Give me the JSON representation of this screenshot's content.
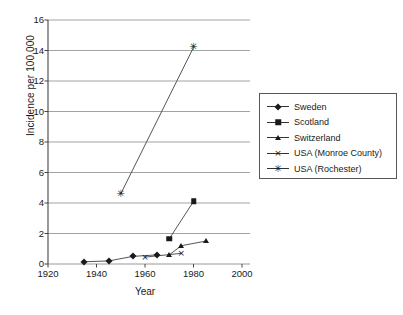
{
  "chart_data": {
    "type": "line",
    "title": "",
    "xlabel": "Year",
    "ylabel": "Incidence per 100,000",
    "xlim": [
      1920,
      2000
    ],
    "ylim": [
      0,
      16
    ],
    "xticks": [
      1920,
      1940,
      1960,
      1980,
      2000
    ],
    "yticks": [
      0,
      2,
      4,
      6,
      8,
      10,
      12,
      14,
      16
    ],
    "grid": "horizontal",
    "legend_position": "right",
    "series": [
      {
        "name": "Sweden",
        "marker": "diamond",
        "x": [
          1935,
          1945,
          1955,
          1965
        ],
        "y": [
          0.15,
          0.2,
          0.5,
          0.6
        ]
      },
      {
        "name": "Scotland",
        "marker": "square",
        "x": [
          1970,
          1980
        ],
        "y": [
          1.65,
          4.1
        ]
      },
      {
        "name": "Switzerland",
        "marker": "triangle",
        "x": [
          1970,
          1975,
          1985
        ],
        "y": [
          0.6,
          1.2,
          1.5
        ]
      },
      {
        "name": "USA (Monroe County)",
        "marker": "cross",
        "x": [
          1960,
          1975
        ],
        "y": [
          0.45,
          0.7
        ]
      },
      {
        "name": "USA (Rochester)",
        "marker": "star",
        "x": [
          1950,
          1980
        ],
        "y": [
          4.6,
          14.2
        ]
      }
    ]
  },
  "colors": {
    "line": "#555555",
    "marker": "#1a1a1a",
    "grid": "#999999",
    "axis": "#444444",
    "legend_border": "#555555"
  }
}
